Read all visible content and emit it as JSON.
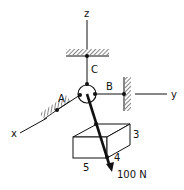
{
  "diagram": {
    "type": "3d-statics-free-body",
    "axes": {
      "x": "x",
      "y": "y",
      "z": "z"
    },
    "supports": {
      "A": "A",
      "B": "B",
      "C": "C"
    },
    "block_dims": {
      "height": "3",
      "depth": "4",
      "width": "5"
    },
    "force": {
      "label": "100 N"
    },
    "colors": {
      "line": "#111111",
      "hatch": "#333333",
      "background": "#ffffff"
    }
  }
}
